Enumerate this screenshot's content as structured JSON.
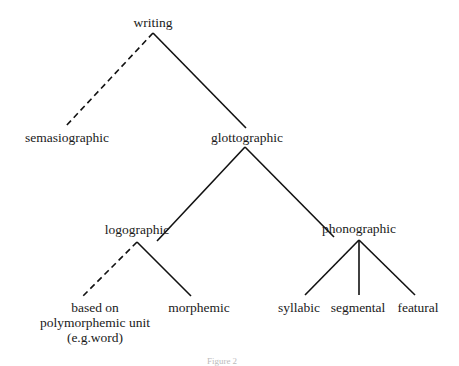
{
  "diagram": {
    "type": "tree",
    "nodes": {
      "root": "writing",
      "semasiographic": "semasiographic",
      "glottographic": "glottographic",
      "logographic": "logographic",
      "phonographic": "phonographic",
      "polymorphemic_line1": "based on",
      "polymorphemic_line2": "polymorphemic unit",
      "polymorphemic_line3": "(e.g.word)",
      "morphemic": "morphemic",
      "syllabic": "syllabic",
      "segmental": "segmental",
      "featural": "featural"
    },
    "edges": [
      {
        "from": "writing",
        "to": "semasiographic",
        "style": "dashed"
      },
      {
        "from": "writing",
        "to": "glottographic",
        "style": "solid"
      },
      {
        "from": "glottographic",
        "to": "logographic",
        "style": "solid"
      },
      {
        "from": "glottographic",
        "to": "phonographic",
        "style": "solid"
      },
      {
        "from": "logographic",
        "to": "based on polymorphemic unit (e.g.word)",
        "style": "dashed"
      },
      {
        "from": "logographic",
        "to": "morphemic",
        "style": "solid"
      },
      {
        "from": "phonographic",
        "to": "syllabic",
        "style": "solid"
      },
      {
        "from": "phonographic",
        "to": "segmental",
        "style": "solid"
      },
      {
        "from": "phonographic",
        "to": "featural",
        "style": "solid"
      }
    ],
    "caption": "Figure 2",
    "colors": {
      "line": "#111111",
      "text": "#1a1a1a"
    }
  }
}
